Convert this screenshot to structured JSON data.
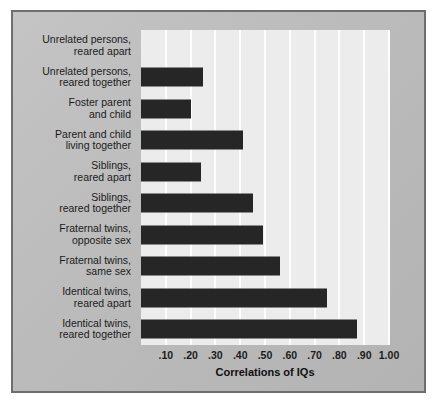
{
  "chart_data": {
    "type": "bar",
    "orientation": "horizontal",
    "title": "",
    "xlabel": "Correlations of IQs",
    "ylabel": "",
    "xlim": [
      0,
      1.0
    ],
    "grid": true,
    "legend": null,
    "categories": [
      "Unrelated persons,\nreared apart",
      "Unrelated persons,\nreared together",
      "Foster parent\nand child",
      "Parent and child\nliving together",
      "Siblings,\nreared apart",
      "Siblings,\nreared together",
      "Fraternal twins,\nopposite sex",
      "Fraternal twins,\nsame sex",
      "Identical twins,\nreared apart",
      "Identical twins,\nreared together"
    ],
    "values": [
      0.0,
      0.25,
      0.2,
      0.41,
      0.24,
      0.45,
      0.49,
      0.56,
      0.75,
      0.87
    ],
    "tick_values": [
      0.1,
      0.2,
      0.3,
      0.4,
      0.5,
      0.6,
      0.7,
      0.8,
      0.9,
      1.0
    ],
    "tick_labels": [
      ".10",
      ".20",
      ".30",
      ".40",
      ".50",
      ".60",
      ".70",
      ".80",
      ".90",
      "1.00"
    ],
    "colors": {
      "bar": "#262626",
      "plot_background": "#ececec",
      "gridline": "#fdfdfd",
      "panel_background": "#bcbcbc",
      "border": "#6e6e6e",
      "text": "#1b1b1b"
    }
  }
}
